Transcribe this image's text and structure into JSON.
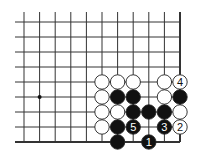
{
  "board": {
    "columns": 11,
    "rows": 9,
    "x0": 24,
    "y0": 22,
    "dx": 15.6,
    "dy": 15,
    "line_color": "#333333",
    "edges": [
      "right",
      "bottom"
    ],
    "star_points": [
      {
        "col": 1,
        "row": 5
      }
    ]
  },
  "stones": [
    {
      "col": 5,
      "row": 4,
      "color": "white",
      "label": ""
    },
    {
      "col": 6,
      "row": 4,
      "color": "white",
      "label": ""
    },
    {
      "col": 7,
      "row": 4,
      "color": "white",
      "label": ""
    },
    {
      "col": 9,
      "row": 4,
      "color": "white",
      "label": ""
    },
    {
      "col": 10,
      "row": 4,
      "color": "white",
      "label": "4"
    },
    {
      "col": 5,
      "row": 5,
      "color": "white",
      "label": ""
    },
    {
      "col": 6,
      "row": 5,
      "color": "black",
      "label": ""
    },
    {
      "col": 7,
      "row": 5,
      "color": "black",
      "label": ""
    },
    {
      "col": 9,
      "row": 5,
      "color": "white",
      "label": ""
    },
    {
      "col": 10,
      "row": 5,
      "color": "black",
      "label": ""
    },
    {
      "col": 5,
      "row": 6,
      "color": "white",
      "label": ""
    },
    {
      "col": 6,
      "row": 6,
      "color": "white",
      "label": ""
    },
    {
      "col": 7,
      "row": 6,
      "color": "black",
      "label": ""
    },
    {
      "col": 8,
      "row": 6,
      "color": "black",
      "label": ""
    },
    {
      "col": 9,
      "row": 6,
      "color": "black",
      "label": ""
    },
    {
      "col": 10,
      "row": 6,
      "color": "white",
      "label": ""
    },
    {
      "col": 5,
      "row": 7,
      "color": "white",
      "label": ""
    },
    {
      "col": 6,
      "row": 7,
      "color": "black",
      "label": ""
    },
    {
      "col": 7,
      "row": 7,
      "color": "black",
      "label": "5"
    },
    {
      "col": 9,
      "row": 7,
      "color": "black",
      "label": "3"
    },
    {
      "col": 10,
      "row": 7,
      "color": "white",
      "label": "2"
    },
    {
      "col": 6,
      "row": 8,
      "color": "black",
      "label": ""
    },
    {
      "col": 8,
      "row": 8,
      "color": "black",
      "label": "1"
    }
  ]
}
